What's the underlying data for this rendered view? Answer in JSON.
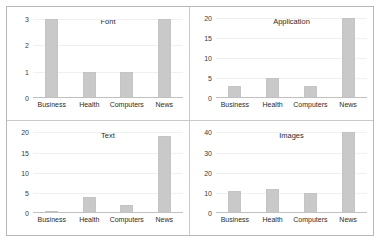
{
  "figure": {
    "background": "#ffffff",
    "frame_color": "#b8b8b8",
    "bar_color": "#c9c9c9",
    "grid_color": "#f0f0f0",
    "layout": "2x2"
  },
  "chart_data": [
    {
      "type": "bar",
      "title": "Font",
      "xlabel": "",
      "ylabel": "",
      "categories": [
        "Business",
        "Health",
        "Computers",
        "News"
      ],
      "values": [
        3,
        1,
        1,
        3
      ],
      "yticks": [
        0,
        1,
        2,
        3
      ],
      "ylim": [
        0,
        3.1
      ],
      "grid": true,
      "legend": "none",
      "panel": "top-left"
    },
    {
      "type": "bar",
      "title": "Application",
      "xlabel": "",
      "ylabel": "",
      "categories": [
        "Business",
        "Health",
        "Computers",
        "News"
      ],
      "values": [
        3,
        5,
        3,
        20
      ],
      "yticks": [
        0,
        5,
        10,
        15,
        20
      ],
      "ylim": [
        0,
        20.6
      ],
      "grid": true,
      "legend": "none",
      "panel": "top-right"
    },
    {
      "type": "bar",
      "title": "Text",
      "xlabel": "",
      "ylabel": "",
      "categories": [
        "Business",
        "Health",
        "Computers",
        "News"
      ],
      "values": [
        0.5,
        4,
        2,
        19
      ],
      "yticks": [
        0,
        5,
        10,
        15,
        20
      ],
      "ylim": [
        0,
        20.6
      ],
      "grid": true,
      "legend": "none",
      "panel": "bottom-left"
    },
    {
      "type": "bar",
      "title": "Images",
      "xlabel": "",
      "ylabel": "",
      "categories": [
        "Business",
        "Health",
        "Computers",
        "News"
      ],
      "values": [
        11,
        12,
        10,
        40
      ],
      "yticks": [
        0,
        10,
        20,
        30,
        40
      ],
      "ylim": [
        0,
        41.2
      ],
      "grid": true,
      "legend": "none",
      "panel": "bottom-right"
    }
  ]
}
